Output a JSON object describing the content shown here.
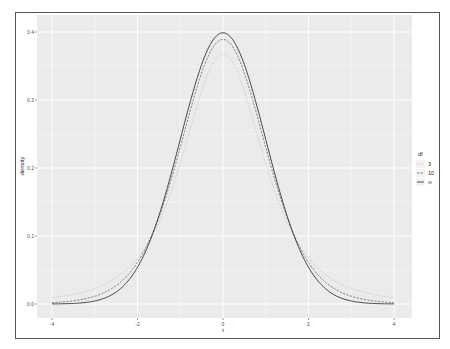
{
  "chart_data": {
    "type": "line",
    "title": "",
    "xlabel": "t",
    "ylabel": "density",
    "xlim": [
      -4,
      4
    ],
    "ylim": [
      0,
      0.4
    ],
    "xticks": [
      -4,
      -2,
      0,
      2,
      4
    ],
    "xtick_labels": [
      "-4",
      "-2",
      "0",
      "2",
      "4"
    ],
    "yticks": [
      0.0,
      0.1,
      0.2,
      0.3,
      0.4
    ],
    "ytick_labels": [
      "0.0",
      "0.1",
      "0.2",
      "0.3",
      "0.4"
    ],
    "grid": true,
    "legend_position": "right",
    "legend": {
      "title": "df",
      "entries": [
        {
          "label": "3",
          "linetype": "dotted",
          "color": "#b0b0b0"
        },
        {
          "label": "10",
          "linetype": "dashed",
          "color": "#555555"
        },
        {
          "label": "∞",
          "linetype": "solid",
          "color": "#222222"
        }
      ]
    },
    "series": [
      {
        "name": "3",
        "function": "student-t pdf, df=3",
        "peak": 0.368,
        "x": [
          -4,
          -3,
          -2,
          -1.5,
          -1,
          -0.5,
          0,
          0.5,
          1,
          1.5,
          2,
          3,
          4
        ],
        "y": [
          0.0092,
          0.023,
          0.0675,
          0.1164,
          0.2067,
          0.3125,
          0.3676,
          0.3125,
          0.2067,
          0.1164,
          0.0675,
          0.023,
          0.0092
        ]
      },
      {
        "name": "10",
        "function": "student-t pdf, df=10",
        "peak": 0.389,
        "x": [
          -4,
          -3,
          -2,
          -1.5,
          -1,
          -0.5,
          0,
          0.5,
          1,
          1.5,
          2,
          3,
          4
        ],
        "y": [
          0.002,
          0.0114,
          0.0611,
          0.1274,
          0.2304,
          0.3397,
          0.3891,
          0.3397,
          0.2304,
          0.1274,
          0.0611,
          0.0114,
          0.002
        ]
      },
      {
        "name": "∞",
        "function": "standard normal pdf",
        "peak": 0.399,
        "x": [
          -4,
          -3,
          -2,
          -1.5,
          -1,
          -0.5,
          0,
          0.5,
          1,
          1.5,
          2,
          3,
          4
        ],
        "y": [
          0.0001,
          0.0044,
          0.054,
          0.1295,
          0.242,
          0.3521,
          0.3989,
          0.3521,
          0.242,
          0.1295,
          0.054,
          0.0044,
          0.0001
        ]
      }
    ]
  },
  "colors": {
    "panel_bg": "#ebebeb",
    "grid": "#ffffff"
  }
}
